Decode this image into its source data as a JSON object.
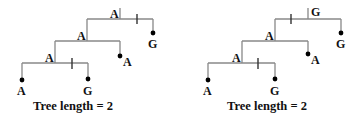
{
  "colors": {
    "line": "#888888",
    "text": "#111111",
    "dot": "#000000"
  },
  "trees": [
    {
      "caption": "Tree length = 2",
      "internal_labels": {
        "root": "A",
        "node2": "A",
        "node3": "A"
      },
      "leaves": [
        "A",
        "G",
        "A",
        "G"
      ],
      "mutations": [
        "A→G on branch to top G leaf",
        "A→G on branch to bottom G leaf"
      ]
    },
    {
      "caption": "Tree length = 2",
      "internal_labels": {
        "root": "G",
        "node2": "A",
        "node3": "A"
      },
      "leaves": [
        "A",
        "G",
        "A",
        "G"
      ],
      "mutations": [
        "G→A on branch below root",
        "A→G on branch to bottom G leaf"
      ]
    }
  ]
}
